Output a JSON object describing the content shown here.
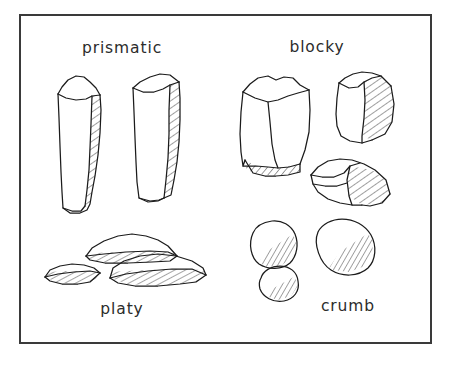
{
  "figure": {
    "frame": {
      "x": 19,
      "y": 14,
      "width": 413,
      "height": 330,
      "stroke_color": "#3a3a3a"
    },
    "background_color": "#ffffff",
    "ink_color": "#1b1b1b"
  },
  "labels": {
    "prismatic": "prismatic",
    "blocky": "blocky",
    "platy": "platy",
    "crumb": "crumb"
  },
  "label_positions": {
    "prismatic": {
      "x": 122,
      "y": 53
    },
    "blocky": {
      "x": 317,
      "y": 52
    },
    "platy": {
      "x": 122,
      "y": 314
    },
    "crumb": {
      "x": 348,
      "y": 311
    }
  },
  "groups": [
    {
      "name": "prismatic",
      "label": "prismatic",
      "description": "Tall vertical column-shaped soil peds with flat tops and hatched shaded right faces",
      "ped_count": 2,
      "peds": [
        {
          "name": "prismatic-ped-left",
          "hatched_face": "right"
        },
        {
          "name": "prismatic-ped-right",
          "hatched_face": "right"
        }
      ]
    },
    {
      "name": "blocky",
      "label": "blocky",
      "description": "Angular cube-like soil peds with flat faces and hatched shaded faces",
      "ped_count": 3,
      "peds": [
        {
          "name": "blocky-ped-large",
          "hatched_face": "bottom"
        },
        {
          "name": "blocky-ped-upper-right",
          "hatched_face": "right"
        },
        {
          "name": "blocky-ped-lower",
          "hatched_face": "right"
        }
      ]
    },
    {
      "name": "platy",
      "label": "platy",
      "description": "Thin flat plate-like soil peds lying horizontally with hatched edges",
      "ped_count": 3,
      "peds": [
        {
          "name": "platy-ped-top",
          "hatched_face": "bottom-edge"
        },
        {
          "name": "platy-ped-bottom-left",
          "hatched_face": "bottom-edge"
        },
        {
          "name": "platy-ped-bottom-right",
          "hatched_face": "bottom-edge"
        }
      ]
    },
    {
      "name": "crumb",
      "label": "crumb",
      "description": "Small rounded irregular soil peds with hatched lower-right shading",
      "ped_count": 3,
      "peds": [
        {
          "name": "crumb-ped-left",
          "hatched_face": "lower-right"
        },
        {
          "name": "crumb-ped-right",
          "hatched_face": "lower-right"
        },
        {
          "name": "crumb-ped-small",
          "hatched_face": "lower-right"
        }
      ]
    }
  ]
}
